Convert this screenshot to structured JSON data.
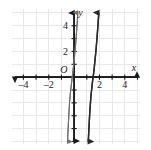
{
  "figure": {
    "title": "",
    "background_color": "#ffffff",
    "grid_color": "#e2e2e6",
    "axis_color": "#1a1a1a",
    "plot_area": {
      "x_min_px": 12,
      "y_min_px": 9,
      "x_max_px": 140,
      "y_max_px": 144
    }
  },
  "chart_data": {
    "type": "line",
    "title": "",
    "xlabel": "x",
    "ylabel": "y",
    "xlim": [
      -4.9,
      5.2
    ],
    "ylim": [
      -5.2,
      5.3
    ],
    "grid": true,
    "gridline_step": 1,
    "legend": "none",
    "origin_label": "O",
    "x_ticks": [
      -4,
      -2,
      2,
      4
    ],
    "x_tick_labels": [
      "–4",
      "–2",
      "2",
      "4"
    ],
    "y_ticks": [
      2,
      4
    ],
    "y_tick_labels": [
      "2",
      "4"
    ],
    "x_axis_arrows": [
      "left",
      "right"
    ],
    "y_axis_arrows": [
      "up",
      "down"
    ],
    "series": [
      {
        "name": "curve-left",
        "color": "#6f6f72",
        "width": 1.1,
        "description": "steep cubic, crosses x-axis near x = -0.15",
        "x_intercept": -0.15,
        "arrow_start": "down",
        "arrow_end": "up",
        "points": [
          [
            -0.52,
            -5.0
          ],
          [
            -0.48,
            -4.2
          ],
          [
            -0.44,
            -3.4
          ],
          [
            -0.4,
            -2.7
          ],
          [
            -0.36,
            -2.0
          ],
          [
            -0.31,
            -1.45
          ],
          [
            -0.27,
            -1.0
          ],
          [
            -0.22,
            -0.6
          ],
          [
            -0.18,
            -0.28
          ],
          [
            -0.15,
            0.0
          ],
          [
            -0.11,
            0.3
          ],
          [
            -0.06,
            0.72
          ],
          [
            0.0,
            1.25
          ],
          [
            0.05,
            1.8
          ],
          [
            0.1,
            2.35
          ],
          [
            0.15,
            2.95
          ],
          [
            0.2,
            3.6
          ],
          [
            0.25,
            4.3
          ],
          [
            0.29,
            5.0
          ]
        ]
      },
      {
        "name": "curve-right",
        "color": "#2a2a2e",
        "width": 1.4,
        "description": "steep cubic shifted right, crosses x-axis near x = 1.5",
        "x_intercept": 1.5,
        "arrow_start": "down",
        "arrow_end": "up",
        "points": [
          [
            1.12,
            -5.0
          ],
          [
            1.16,
            -4.2
          ],
          [
            1.2,
            -3.4
          ],
          [
            1.24,
            -2.7
          ],
          [
            1.29,
            -2.0
          ],
          [
            1.33,
            -1.45
          ],
          [
            1.38,
            -1.0
          ],
          [
            1.42,
            -0.6
          ],
          [
            1.46,
            -0.28
          ],
          [
            1.5,
            0.0
          ],
          [
            1.54,
            0.3
          ],
          [
            1.59,
            0.72
          ],
          [
            1.64,
            1.25
          ],
          [
            1.7,
            1.8
          ],
          [
            1.75,
            2.35
          ],
          [
            1.8,
            2.95
          ],
          [
            1.85,
            3.6
          ],
          [
            1.9,
            4.3
          ],
          [
            1.95,
            5.0
          ]
        ]
      }
    ]
  }
}
